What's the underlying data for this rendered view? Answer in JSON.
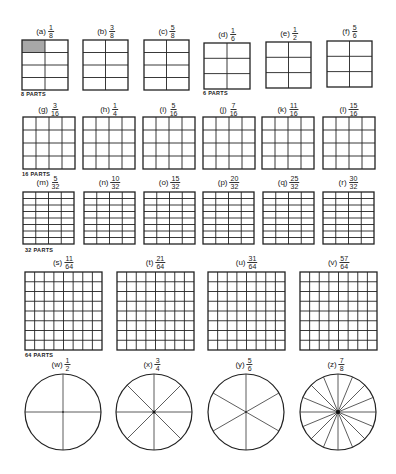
{
  "sections": [
    {
      "parts_label": "8 PARTS",
      "items": [
        {
          "letter": "(a)",
          "num": "1",
          "den": "8",
          "cols": 2,
          "rows": 4,
          "shaded": 1
        },
        {
          "letter": "(b)",
          "num": "3",
          "den": "8",
          "cols": 2,
          "rows": 4,
          "shaded": 0
        },
        {
          "letter": "(c)",
          "num": "5",
          "den": "8",
          "cols": 2,
          "rows": 4,
          "shaded": 0
        }
      ]
    },
    {
      "parts_label": "6 PARTS",
      "items": [
        {
          "letter": "(d)",
          "num": "1",
          "den": "6",
          "cols": 2,
          "rows": 3,
          "shaded": 0
        },
        {
          "letter": "(e)",
          "num": "1",
          "den": "2",
          "cols": 2,
          "rows": 3,
          "shaded": 0
        },
        {
          "letter": "(f)",
          "num": "5",
          "den": "6",
          "cols": 2,
          "rows": 3,
          "shaded": 0
        }
      ]
    },
    {
      "parts_label": "16 PARTS",
      "items": [
        {
          "letter": "(g)",
          "num": "3",
          "den": "16",
          "cols": 4,
          "rows": 4
        },
        {
          "letter": "(h)",
          "num": "1",
          "den": "4",
          "cols": 4,
          "rows": 4
        },
        {
          "letter": "(i)",
          "num": "5",
          "den": "16",
          "cols": 4,
          "rows": 4
        },
        {
          "letter": "(j)",
          "num": "7",
          "den": "16",
          "cols": 4,
          "rows": 4
        },
        {
          "letter": "(k)",
          "num": "11",
          "den": "16",
          "cols": 4,
          "rows": 4
        },
        {
          "letter": "(l)",
          "num": "15",
          "den": "16",
          "cols": 4,
          "rows": 4
        }
      ]
    },
    {
      "parts_label": "32 PARTS",
      "items": [
        {
          "letter": "(m)",
          "num": "5",
          "den": "32",
          "cols": 4,
          "rows": 8
        },
        {
          "letter": "(n)",
          "num": "10",
          "den": "32",
          "cols": 4,
          "rows": 8
        },
        {
          "letter": "(o)",
          "num": "15",
          "den": "32",
          "cols": 4,
          "rows": 8
        },
        {
          "letter": "(p)",
          "num": "20",
          "den": "32",
          "cols": 4,
          "rows": 8
        },
        {
          "letter": "(q)",
          "num": "25",
          "den": "32",
          "cols": 4,
          "rows": 8
        },
        {
          "letter": "(r)",
          "num": "30",
          "den": "32",
          "cols": 4,
          "rows": 8
        }
      ]
    },
    {
      "parts_label": "64 PARTS",
      "items": [
        {
          "letter": "(s)",
          "num": "11",
          "den": "64",
          "cols": 8,
          "rows": 8
        },
        {
          "letter": "(t)",
          "num": "21",
          "den": "64",
          "cols": 8,
          "rows": 8
        },
        {
          "letter": "(u)",
          "num": "31",
          "den": "64",
          "cols": 8,
          "rows": 8
        },
        {
          "letter": "(v)",
          "num": "57",
          "den": "64",
          "cols": 8,
          "rows": 8
        }
      ]
    },
    {
      "parts_label": "",
      "items": [
        {
          "letter": "(w)",
          "num": "1",
          "den": "2",
          "segments": 4
        },
        {
          "letter": "(x)",
          "num": "3",
          "den": "4",
          "segments": 8
        },
        {
          "letter": "(y)",
          "num": "5",
          "den": "6",
          "segments": 6
        },
        {
          "letter": "(z)",
          "num": "7",
          "den": "8",
          "segments": 16
        }
      ]
    }
  ],
  "colors": {
    "line": "#222222",
    "shade": "#a8a8a8",
    "background": "#ffffff"
  }
}
